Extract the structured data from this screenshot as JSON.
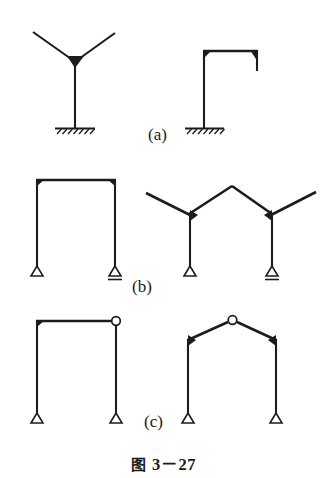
{
  "figure": {
    "caption_mark": "图",
    "caption_number": "3－27",
    "caption_full": "图 3－27",
    "background_color": "#ffffff",
    "line_color": "#1c1c1c"
  },
  "rows": [
    {
      "label": "(a)",
      "label_x": 148,
      "label_y": 140,
      "description": "Fixed-base frames: tree (Y) column and single-bay frame with cantilever stub",
      "figures": [
        {
          "name": "y-branch-fixed-column",
          "support_left": "fixed",
          "support_right": "none",
          "joint_type": "rigid"
        },
        {
          "name": "cantilever-beam-fixed-column",
          "support_left": "fixed",
          "support_right": "none",
          "joint_type": "rigid"
        }
      ]
    },
    {
      "label": "(b)",
      "label_x": 132,
      "label_y": 292,
      "description": "Rigid portal frame and gabled frame with overhangs, pin and roller supports",
      "figures": [
        {
          "name": "rigid-portal-frame",
          "support_left": "pin",
          "support_right": "roller",
          "joint_type": "rigid"
        },
        {
          "name": "gabled-frame-with-overhangs",
          "support_left": "pin",
          "support_right": "roller",
          "joint_type": "rigid"
        }
      ]
    },
    {
      "label": "(c)",
      "label_x": 144,
      "label_y": 427,
      "description": "Three-hinged style frames: portal with corner hinge and gabled frame with apex hinge",
      "figures": [
        {
          "name": "portal-frame-corner-hinge",
          "support_left": "pin",
          "support_right": "pin",
          "joint_type": "hinge-at-right-corner"
        },
        {
          "name": "gabled-frame-apex-hinge",
          "support_left": "pin",
          "support_right": "pin",
          "joint_type": "hinge-at-apex"
        }
      ]
    }
  ],
  "legend_symbols": {
    "fixed_support": "hatched-ground",
    "pin_support": "open-triangle",
    "roller_support": "triangle-with-baseline",
    "hinge": "open-circle",
    "rigid_joint": "filled-haunch"
  }
}
